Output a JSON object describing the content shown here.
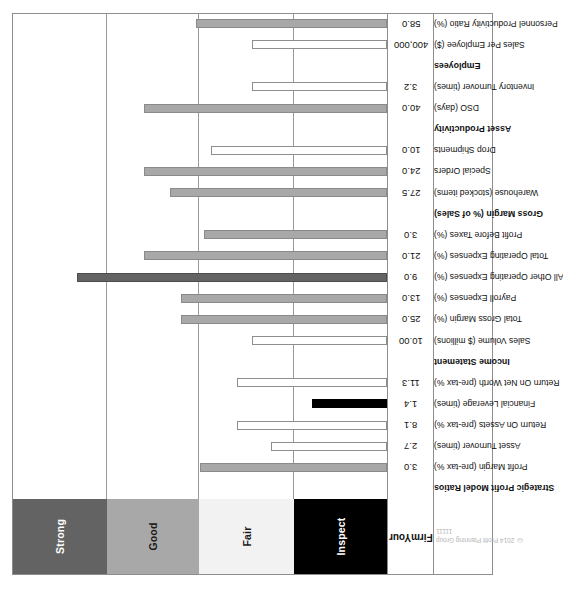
{
  "copyright": {
    "line1": "© 2014 Profit Planning Group",
    "line2": "11111"
  },
  "value_header": {
    "line1": "Your",
    "line2": "Firm"
  },
  "zones": [
    {
      "name": "strong",
      "label": "Strong",
      "color": "#636363",
      "text_color": "#ffffff"
    },
    {
      "name": "good",
      "label": "Good",
      "color": "#a8a8a8",
      "text_color": "#1a1a1a"
    },
    {
      "name": "fair",
      "label": "Fair",
      "color": "#f2f2f2",
      "text_color": "#1a1a1a"
    },
    {
      "name": "inspect",
      "label": "Inspect",
      "color": "#000000",
      "text_color": "#ffffff"
    }
  ],
  "chart_data": {
    "type": "bar",
    "title": "Strategic Profit Model Ratios",
    "xlabel": "",
    "ylabel": "",
    "grid": true,
    "legend_position": "left",
    "zone_bands": [
      {
        "label": "Inspect",
        "from": 0,
        "to": 25
      },
      {
        "label": "Fair",
        "from": 25,
        "to": 50
      },
      {
        "label": "Good",
        "from": 50,
        "to": 75
      },
      {
        "label": "Strong",
        "from": 75,
        "to": 100
      }
    ],
    "ylim": [
      0,
      100
    ],
    "categories": [
      "Strategic Profit Model Ratios",
      "Profit Margin (pre-tax %)",
      "Asset Turnover (times)",
      "Return On Assets (pre-tax %)",
      "Financial Leverage (times)",
      "Return On Net Worth (pre-tax %)",
      "Income Statement",
      "Sales Volume ($ millions)",
      "Total Gross Margin (%)",
      "Payroll Expenses (%)",
      "All Other Operating Expenses (%)",
      "Total Operating Expenses (%)",
      "Profit Before Taxes (%)",
      "Gross Margin (% of Sales)",
      "Warehouse (stocked items)",
      "Special Orders",
      "Drop Shipments",
      "Asset Productivity",
      "DSO (days)",
      "Inventory Turnover (times)",
      "Employees",
      "Sales Per Employee ($)",
      "Personnel Productivity Ratio (%)"
    ],
    "values": [
      null,
      "3.0",
      "2.7",
      "8.1",
      "1.4",
      "11.3",
      null,
      "10.00",
      "25.0",
      "13.0",
      "9.0",
      "21.0",
      "3.0",
      null,
      "27.5",
      "24.0",
      "10.0",
      null,
      "40.0",
      "3.2",
      null,
      "400,000",
      "58.0"
    ]
  },
  "rows": [
    {
      "label": "Strategic Profit Model Ratios",
      "value": "",
      "header": true,
      "bar": null
    },
    {
      "label": "Profit Margin (pre-tax %)",
      "value": "3.0",
      "header": false,
      "bar": {
        "height_pct": 50,
        "style": "filled-light"
      }
    },
    {
      "label": "Asset Turnover (times)",
      "value": "2.7",
      "header": false,
      "bar": {
        "height_pct": 31,
        "style": "hollow"
      }
    },
    {
      "label": "Return On Assets (pre-tax %)",
      "value": "8.1",
      "header": false,
      "bar": {
        "height_pct": 40,
        "style": "hollow"
      }
    },
    {
      "label": "Financial Leverage (times)",
      "value": "1.4",
      "header": false,
      "bar": {
        "height_pct": 20,
        "style": "filled-black"
      }
    },
    {
      "label": "Return On Net Worth (pre-tax %)",
      "value": "11.3",
      "header": false,
      "bar": {
        "height_pct": 40,
        "style": "hollow"
      }
    },
    {
      "label": "Income Statement",
      "value": "",
      "header": true,
      "bar": null
    },
    {
      "label": "Sales Volume ($ millions)",
      "value": "10.00",
      "header": false,
      "bar": {
        "height_pct": 36,
        "style": "hollow"
      }
    },
    {
      "label": "Total Gross Margin (%)",
      "value": "25.0",
      "header": false,
      "bar": {
        "height_pct": 55,
        "style": "filled-light"
      }
    },
    {
      "label": "Payroll Expenses (%)",
      "value": "13.0",
      "header": false,
      "bar": {
        "height_pct": 55,
        "style": "filled-light"
      }
    },
    {
      "label": "All Other Operating Expenses (%)",
      "value": "9.0",
      "header": false,
      "bar": {
        "height_pct": 83,
        "style": "filled-dark"
      }
    },
    {
      "label": "Total Operating Expenses (%)",
      "value": "21.0",
      "header": false,
      "bar": {
        "height_pct": 65,
        "style": "filled-light"
      }
    },
    {
      "label": "Profit Before Taxes (%)",
      "value": "3.0",
      "header": false,
      "bar": {
        "height_pct": 49,
        "style": "filled-light"
      }
    },
    {
      "label": "Gross Margin (% of Sales)",
      "value": "",
      "header": true,
      "bar": null
    },
    {
      "label": "Warehouse (stocked items)",
      "value": "27.5",
      "header": false,
      "bar": {
        "height_pct": 58,
        "style": "filled-light"
      }
    },
    {
      "label": "Special Orders",
      "value": "24.0",
      "header": false,
      "bar": {
        "height_pct": 65,
        "style": "filled-light"
      }
    },
    {
      "label": "Drop Shipments",
      "value": "10.0",
      "header": false,
      "bar": {
        "height_pct": 47,
        "style": "hollow"
      }
    },
    {
      "label": "Asset Productivity",
      "value": "",
      "header": true,
      "bar": null
    },
    {
      "label": "DSO (days)",
      "value": "40.0",
      "header": false,
      "bar": {
        "height_pct": 65,
        "style": "filled-light"
      }
    },
    {
      "label": "Inventory Turnover (times)",
      "value": "3.2",
      "header": false,
      "bar": {
        "height_pct": 36,
        "style": "hollow"
      }
    },
    {
      "label": "Employees",
      "value": "",
      "header": true,
      "bar": null
    },
    {
      "label": "Sales Per Employee ($)",
      "value": "400,000",
      "header": false,
      "bar": {
        "height_pct": 36,
        "style": "hollow"
      }
    },
    {
      "label": "Personnel Productivity Ratio (%)",
      "value": "58.0",
      "header": false,
      "bar": {
        "height_pct": 51,
        "style": "filled-light"
      }
    }
  ]
}
